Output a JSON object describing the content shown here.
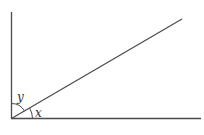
{
  "diagram": {
    "type": "angle-diagram",
    "labels": {
      "angle_upper": "y",
      "angle_lower": "x"
    },
    "colors": {
      "line": "#4a4a4a",
      "text": "#333333",
      "background": "#ffffff"
    }
  }
}
